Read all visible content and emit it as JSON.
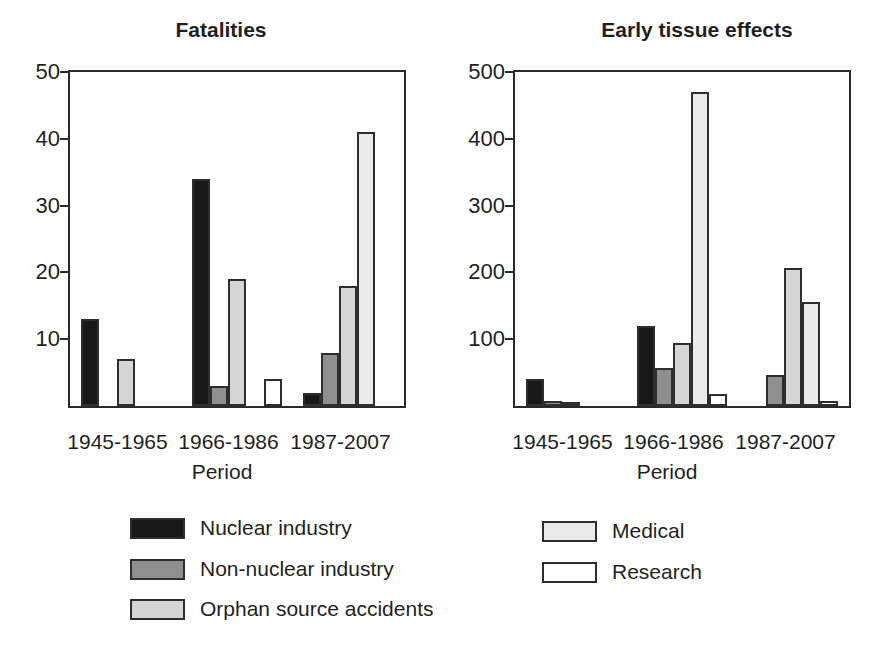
{
  "figure": {
    "background": "#ffffff"
  },
  "chart_data": [
    {
      "type": "bar",
      "title": "Fatalities",
      "xlabel": "Period",
      "categories": [
        "1945-1965",
        "1966-1986",
        "1987-2007"
      ],
      "series": [
        {
          "name": "Nuclear industry",
          "color": "#181818",
          "values": [
            13,
            34,
            2
          ]
        },
        {
          "name": "Non-nuclear industry",
          "color": "#8f8f8f",
          "values": [
            0,
            3,
            8
          ]
        },
        {
          "name": "Orphan source accidents",
          "color": "#d5d5d5",
          "values": [
            7,
            19,
            18
          ]
        },
        {
          "name": "Medical",
          "color": "#eaeaea",
          "values": [
            0,
            0,
            41
          ]
        },
        {
          "name": "Research",
          "color": "#ffffff",
          "values": [
            0,
            4,
            0
          ]
        }
      ],
      "ylim": [
        0,
        50
      ],
      "yticks": [
        10,
        20,
        30,
        40,
        50
      ],
      "grid": false,
      "legend_position": "below"
    },
    {
      "type": "bar",
      "title": "Early tissue effects",
      "xlabel": "Period",
      "categories": [
        "1945-1965",
        "1966-1986",
        "1987-2007"
      ],
      "series": [
        {
          "name": "Nuclear industry",
          "color": "#181818",
          "values": [
            40,
            120,
            0
          ]
        },
        {
          "name": "Non-nuclear industry",
          "color": "#8f8f8f",
          "values": [
            8,
            57,
            47
          ]
        },
        {
          "name": "Orphan source accidents",
          "color": "#d5d5d5",
          "values": [
            5,
            94,
            207
          ]
        },
        {
          "name": "Medical",
          "color": "#eaeaea",
          "values": [
            0,
            470,
            155
          ]
        },
        {
          "name": "Research",
          "color": "#ffffff",
          "values": [
            0,
            18,
            8
          ]
        }
      ],
      "ylim": [
        0,
        500
      ],
      "yticks": [
        100,
        200,
        300,
        400,
        500
      ],
      "grid": false,
      "legend_position": "below"
    }
  ],
  "legend": {
    "columns": [
      [
        "Nuclear industry",
        "Non-nuclear industry",
        "Orphan source accidents"
      ],
      [
        "Medical",
        "Research"
      ]
    ]
  },
  "colors": {
    "axis": "#2a2a2a",
    "text": "#1f1f1f",
    "bar_outline": "#2e2e2e",
    "background": "#ffffff"
  }
}
